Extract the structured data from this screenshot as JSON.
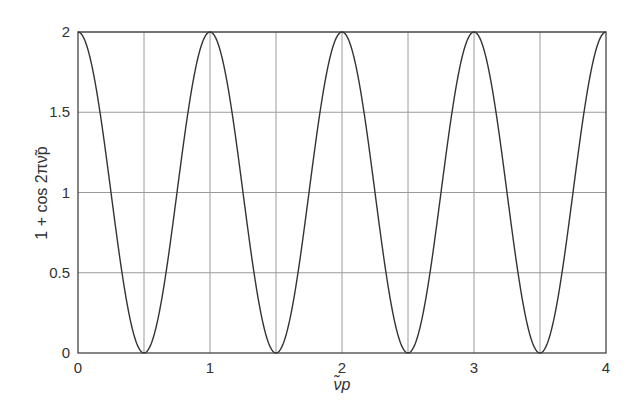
{
  "chart_data": {
    "type": "line",
    "title": "",
    "xlabel": "ν̃p",
    "ylabel": "1 + cos 2πν̃p",
    "xlim": [
      0,
      4
    ],
    "ylim": [
      0,
      2
    ],
    "xticks": [
      0,
      1,
      2,
      3,
      4
    ],
    "xtick_labels": [
      "0",
      "1",
      "2",
      "3",
      "4"
    ],
    "yticks": [
      0,
      0.5,
      1,
      1.5,
      2
    ],
    "ytick_labels": [
      "0",
      "0.5",
      "1",
      "1.5",
      "2"
    ],
    "x_gridlines": [
      0.5,
      1,
      1.5,
      2,
      2.5,
      3,
      3.5
    ],
    "y_gridlines": [
      0.5,
      1,
      1.5,
      2
    ],
    "grid": true,
    "legend": null,
    "function": "1 + cos(2*pi*x)",
    "series": [
      {
        "name": "1 + cos 2πν̃p",
        "x": [
          0,
          0.125,
          0.25,
          0.375,
          0.5,
          0.625,
          0.75,
          0.875,
          1,
          1.125,
          1.25,
          1.375,
          1.5,
          1.625,
          1.75,
          1.875,
          2,
          2.125,
          2.25,
          2.375,
          2.5,
          2.625,
          2.75,
          2.875,
          3,
          3.125,
          3.25,
          3.375,
          3.5,
          3.625,
          3.75,
          3.875,
          4
        ],
        "values": [
          2,
          1.707,
          1,
          0.293,
          0,
          0.293,
          1,
          1.707,
          2,
          1.707,
          1,
          0.293,
          0,
          0.293,
          1,
          1.707,
          2,
          1.707,
          1,
          0.293,
          0,
          0.293,
          1,
          1.707,
          2,
          1.707,
          1,
          0.293,
          0,
          0.293,
          1,
          1.707,
          2
        ]
      }
    ],
    "colors": {
      "curve": "#333333",
      "grid": "#9a9a9a",
      "axis": "#444444"
    }
  }
}
